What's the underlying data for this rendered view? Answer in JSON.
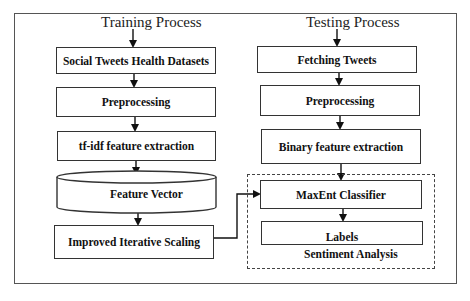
{
  "diagram": {
    "training": {
      "title": "Training Process",
      "steps": [
        "Social Tweets Health Datasets",
        "Preprocessing",
        "tf-idf feature extraction",
        "Feature Vector",
        "Improved Iterative Scaling"
      ]
    },
    "testing": {
      "title": "Testing Process",
      "steps": [
        "Fetching Tweets",
        "Preprocessing",
        "Binary feature extraction",
        "MaxEnt Classifier",
        "Labels"
      ],
      "group_label": "Sentiment Analysis"
    }
  }
}
